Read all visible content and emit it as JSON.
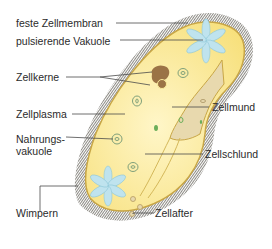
{
  "diagram": {
    "colors": {
      "cilia": "#8c8a84",
      "membrane": "#c8a646",
      "cytoplasm": "#fbeb9c",
      "cytoplasm_light": "#fff6c8",
      "oral_groove": "#e8d9ae",
      "nucleus": "#9b7346",
      "contractile_vacuole": "#bfe3ee",
      "food_vacuole": "#7fa07a",
      "leader_line": "#4a4a4a"
    },
    "labels": [
      {
        "id": "feste-zellmembran",
        "text": "feste Zellmembran"
      },
      {
        "id": "pulsierende-vakuole",
        "text": "pulsierende Vakuole"
      },
      {
        "id": "zellkerne",
        "text": "Zellkerne"
      },
      {
        "id": "zellplasma",
        "text": "Zellplasma"
      },
      {
        "id": "nahrungsvakuole",
        "text": "Nahrungs-",
        "text2": "vakuole"
      },
      {
        "id": "wimpern",
        "text": "Wimpern"
      },
      {
        "id": "zellmund",
        "text": "Zellmund"
      },
      {
        "id": "zellschlund",
        "text": "Zellschlund"
      },
      {
        "id": "zellafter",
        "text": "Zellafter"
      }
    ]
  }
}
